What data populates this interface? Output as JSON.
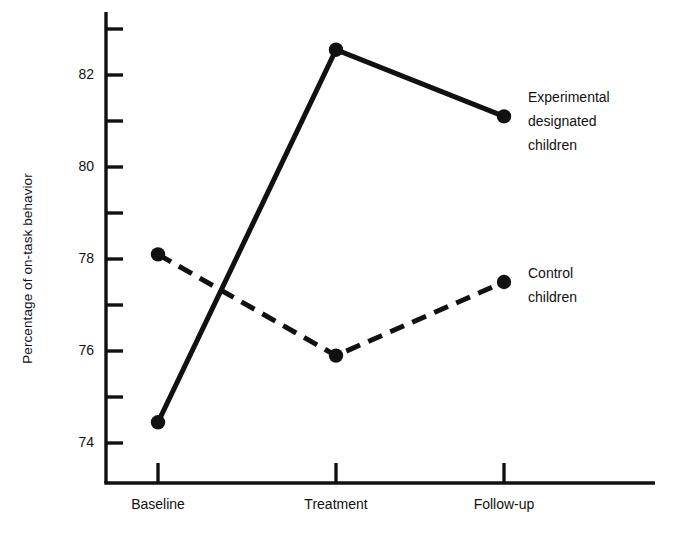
{
  "chart_data": {
    "type": "line",
    "title": "",
    "xlabel": "",
    "ylabel": "Percentage of on-task behavior",
    "categories": [
      "Baseline",
      "Treatment",
      "Follow-up"
    ],
    "ylim": [
      73.2,
      83.2
    ],
    "yticks_major": [
      74,
      76,
      78,
      80,
      82
    ],
    "yticks_minor": [
      75,
      77,
      79,
      81,
      83
    ],
    "ytick_labels": [
      "74",
      "76",
      "78",
      "80",
      "82"
    ],
    "grid": false,
    "legend_position": "inline-right",
    "series": [
      {
        "name": "Experimental designated children",
        "label_lines": [
          "Experimental",
          "designated",
          "children"
        ],
        "style": "solid",
        "color": "#111111",
        "marker": "filled-circle",
        "values": [
          74.45,
          82.55,
          81.1
        ]
      },
      {
        "name": "Control children",
        "label_lines": [
          "Control",
          "children"
        ],
        "style": "dashed",
        "color": "#111111",
        "marker": "filled-circle",
        "values": [
          78.1,
          75.9,
          77.5
        ]
      }
    ]
  },
  "axes": {
    "y_axis_name": "y-axis",
    "x_axis_name": "x-axis"
  }
}
